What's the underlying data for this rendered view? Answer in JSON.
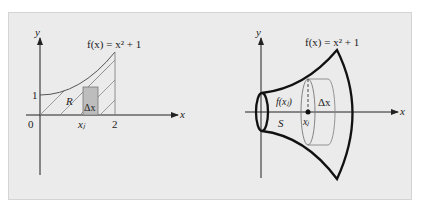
{
  "figure": {
    "left_panel": {
      "function_label": "f(x) = x² + 1",
      "axis_x": "x",
      "axis_y": "y",
      "tick_origin": "0",
      "tick_y1": "1",
      "tick_x2": "2",
      "region_label": "R",
      "sample_point_label": "xⱼ",
      "strip_label": "Δx"
    },
    "right_panel": {
      "function_label": "f(x) = x² + 1",
      "axis_x": "x",
      "axis_y": "y",
      "solid_label": "S",
      "radius_label": "f(xⱼ)",
      "sample_point_label": "xⱼ",
      "disk_label": "Δx"
    },
    "colors": {
      "background": "#ebebeb",
      "curve": "#222222",
      "strip_fill": "#bdbdbd",
      "hatch": "#888888"
    }
  }
}
